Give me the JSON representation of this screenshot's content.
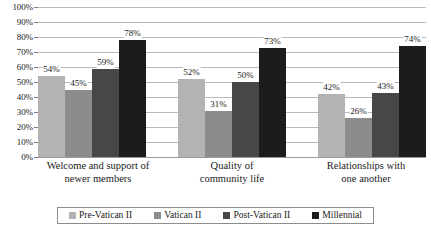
{
  "chart_data": {
    "type": "bar",
    "title": "",
    "subtitle": "",
    "xlabel": "",
    "ylabel": "",
    "ylim": [
      0,
      100
    ],
    "ytick_labels": [
      "100%",
      "90%",
      "80%",
      "70%",
      "60%",
      "50%",
      "40%",
      "30%",
      "20%",
      "10%",
      "0%"
    ],
    "ytick_values": [
      100,
      90,
      80,
      70,
      60,
      50,
      40,
      30,
      20,
      10,
      0
    ],
    "grid": true,
    "legend_position": "bottom",
    "value_label_suffix": "%",
    "categories": [
      "Welcome and support of newer members",
      "Quality of community life",
      "Relationships with one another"
    ],
    "category_lines": [
      [
        "Welcome and support of",
        "newer members"
      ],
      [
        "Quality of",
        "community life"
      ],
      [
        "Relationships with",
        "one another"
      ]
    ],
    "series": [
      {
        "name": "Pre-Vatican II",
        "color": "#b3b3b3",
        "values": [
          54,
          52,
          42
        ],
        "labels": [
          "54%",
          "52%",
          "42%"
        ]
      },
      {
        "name": "Vatican II",
        "color": "#8c8c8c",
        "values": [
          45,
          31,
          26
        ],
        "labels": [
          "45%",
          "31%",
          "26%"
        ]
      },
      {
        "name": "Post-Vatican II",
        "color": "#474747",
        "values": [
          59,
          50,
          43
        ],
        "labels": [
          "59%",
          "50%",
          "43%"
        ]
      },
      {
        "name": "Millennial",
        "color": "#1c1c1c",
        "values": [
          78,
          73,
          74
        ],
        "labels": [
          "78%",
          "73%",
          "74%"
        ]
      }
    ]
  },
  "colors": {
    "gridline": "#b9b9b9",
    "axis": "#9a9a9a",
    "text": "#1a1a1a",
    "legend_border": "#8c8c8c",
    "background": "#ffffff"
  }
}
